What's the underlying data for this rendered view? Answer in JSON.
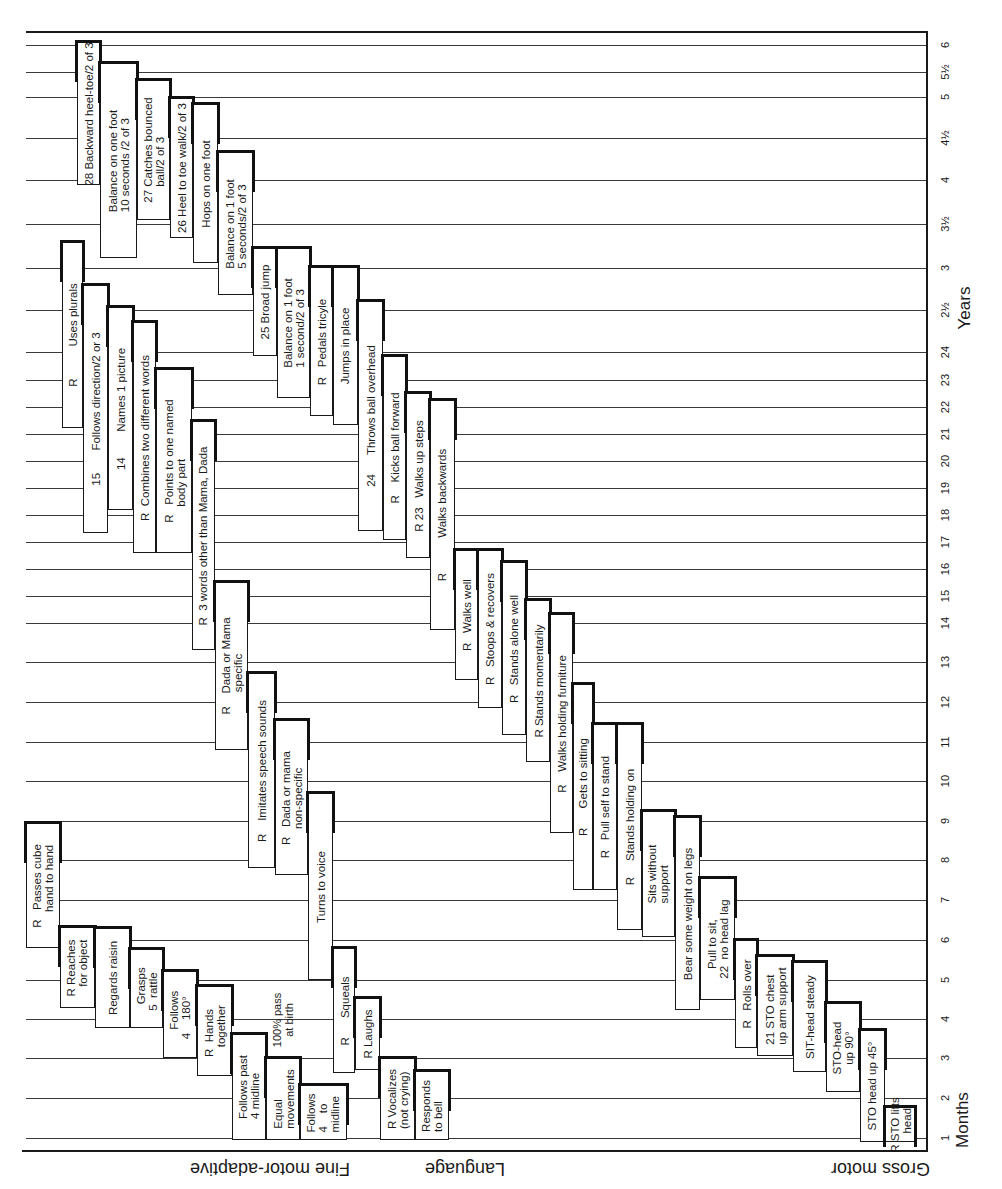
{
  "chart_data": {
    "type": "table",
    "xlabel": "Age",
    "axis_months_label": "Months",
    "axis_years_label": "Years",
    "ticks": [
      {
        "label": "6",
        "y": 45
      },
      {
        "label": "5½",
        "y": 72
      },
      {
        "label": "5",
        "y": 97
      },
      {
        "label": "4½",
        "y": 138
      },
      {
        "label": "4",
        "y": 180
      },
      {
        "label": "3½",
        "y": 224
      },
      {
        "label": "3",
        "y": 268
      },
      {
        "label": "2½",
        "y": 310
      },
      {
        "label": "24",
        "y": 352
      },
      {
        "label": "23",
        "y": 380
      },
      {
        "label": "22",
        "y": 407
      },
      {
        "label": "21",
        "y": 434
      },
      {
        "label": "20",
        "y": 461
      },
      {
        "label": "19",
        "y": 488
      },
      {
        "label": "18",
        "y": 515
      },
      {
        "label": "17",
        "y": 542
      },
      {
        "label": "16",
        "y": 569
      },
      {
        "label": "15",
        "y": 596
      },
      {
        "label": "14",
        "y": 623
      },
      {
        "label": "13",
        "y": 662
      },
      {
        "label": "12",
        "y": 702
      },
      {
        "label": "11",
        "y": 742
      },
      {
        "label": "10",
        "y": 781
      },
      {
        "label": "9",
        "y": 821
      },
      {
        "label": "8",
        "y": 860
      },
      {
        "label": "7",
        "y": 900
      },
      {
        "label": "6",
        "y": 940
      },
      {
        "label": "5",
        "y": 980
      },
      {
        "label": "4",
        "y": 1019
      },
      {
        "label": "3",
        "y": 1058
      },
      {
        "label": "2",
        "y": 1098
      },
      {
        "label": "1",
        "y": 1138
      }
    ],
    "sectors": [
      {
        "name": "Fine motor-adaptive"
      },
      {
        "name": "Language"
      },
      {
        "name": "Gross motor"
      }
    ],
    "items": [
      {
        "sector": "Fine motor-adaptive",
        "text": "R   Passes cube\n     hand to hand",
        "x": 26,
        "w": 34,
        "y": 823,
        "h": 125
      },
      {
        "sector": "Fine motor-adaptive",
        "text": "R Reaches\n   for object",
        "x": 60,
        "w": 35,
        "y": 927,
        "h": 81
      },
      {
        "sector": "Fine motor-adaptive",
        "text": "Regards raisin",
        "x": 95,
        "w": 35,
        "y": 928,
        "h": 100
      },
      {
        "sector": "Fine motor-adaptive",
        "text": "  Grasps\n5  rattle",
        "x": 130,
        "w": 33,
        "y": 949,
        "h": 79
      },
      {
        "sector": "Fine motor-adaptive",
        "text": "   Follows\n4    180°",
        "x": 163,
        "w": 34,
        "y": 971,
        "h": 87
      },
      {
        "sector": "Fine motor-adaptive",
        "text": "R  Hands\n   together",
        "x": 197,
        "w": 35,
        "y": 986,
        "h": 90
      },
      {
        "sector": "Fine motor-adaptive",
        "text": "Follows past\n4 midline",
        "x": 232,
        "w": 34,
        "y": 1034,
        "h": 106
      },
      {
        "sector": "Fine motor-adaptive",
        "text": "Equal\nmovements",
        "x": 266,
        "w": 34,
        "y": 1058,
        "h": 82
      },
      {
        "sector": "Fine motor-adaptive",
        "text": "Follows\n4    to\nmidline",
        "x": 300,
        "w": 47,
        "y": 1085,
        "h": 55
      },
      {
        "sector": "Language",
        "text": "R          Uses plurals",
        "x": 62,
        "w": 21,
        "y": 242,
        "h": 186
      },
      {
        "sector": "Language",
        "text": "15       Follows direction/2 or 3",
        "x": 83,
        "w": 25,
        "y": 285,
        "h": 248
      },
      {
        "sector": "Language",
        "text": "14        Names 1 picture",
        "x": 108,
        "w": 25,
        "y": 307,
        "h": 203
      },
      {
        "sector": "Language",
        "text": "R  Combines two different words",
        "x": 133,
        "w": 23,
        "y": 322,
        "h": 231
      },
      {
        "sector": "Language",
        "text": "R   Points to one named\n     body part",
        "x": 156,
        "w": 36,
        "y": 369,
        "h": 184
      },
      {
        "sector": "Language",
        "text": "R  3 words other than Mama, Dada",
        "x": 192,
        "w": 23,
        "y": 421,
        "h": 229
      },
      {
        "sector": "Language",
        "text": "R    Dada or Mama\n       specific",
        "x": 215,
        "w": 33,
        "y": 582,
        "h": 168
      },
      {
        "sector": "Language",
        "text": "R    Imitates speech sounds",
        "x": 248,
        "w": 27,
        "y": 673,
        "h": 195
      },
      {
        "sector": "Language",
        "text": "R   Dada or mama\n     non-specific",
        "x": 275,
        "w": 33,
        "y": 720,
        "h": 155
      },
      {
        "sector": "Language",
        "text": "Turns to voice",
        "x": 308,
        "w": 25,
        "y": 793,
        "h": 187
      },
      {
        "sector": "Language",
        "text": "R      Squeals",
        "x": 333,
        "w": 22,
        "y": 948,
        "h": 125
      },
      {
        "sector": "Language",
        "text": "R Laughs",
        "x": 355,
        "w": 25,
        "y": 998,
        "h": 72
      },
      {
        "sector": "Language",
        "text": "R Vocalizes\n(not crying)",
        "x": 380,
        "w": 35,
        "y": 1058,
        "h": 82
      },
      {
        "sector": "Language",
        "text": "Responds\nto bell",
        "x": 415,
        "w": 34,
        "y": 1071,
        "h": 69
      },
      {
        "sector": "Gross motor",
        "text": "28 Backward heel-toe/2 of 3",
        "x": 77,
        "w": 23,
        "y": 42,
        "h": 143
      },
      {
        "sector": "Gross motor",
        "text": "Balance on one foot\n10 seconds /2 of 3",
        "x": 100,
        "w": 37,
        "y": 63,
        "h": 195
      },
      {
        "sector": "Gross motor",
        "text": "27 Catches bounced\n     ball/2 of 3",
        "x": 137,
        "w": 33,
        "y": 80,
        "h": 140
      },
      {
        "sector": "Gross motor",
        "text": "26 Heel to toe walk/2 of 3",
        "x": 170,
        "w": 23,
        "y": 98,
        "h": 140
      },
      {
        "sector": "Gross motor",
        "text": "Hops on one foot",
        "x": 193,
        "w": 25,
        "y": 104,
        "h": 159
      },
      {
        "sector": "Gross motor",
        "text": "Balance on 1 foot\n5 seconds/2 of 3",
        "x": 218,
        "w": 35,
        "y": 152,
        "h": 143
      },
      {
        "sector": "Gross motor",
        "text": "25 Broad jump",
        "x": 253,
        "w": 24,
        "y": 248,
        "h": 108
      },
      {
        "sector": "Gross motor",
        "text": "Balance on 1 foot\n1 second/2 of 3",
        "x": 277,
        "w": 33,
        "y": 248,
        "h": 150
      },
      {
        "sector": "Gross motor",
        "text": "R   Pedals tricyle",
        "x": 310,
        "w": 23,
        "y": 267,
        "h": 149
      },
      {
        "sector": "Gross motor",
        "text": "Jumps in place",
        "x": 333,
        "w": 25,
        "y": 267,
        "h": 158
      },
      {
        "sector": "Gross motor",
        "text": "24      Throws ball overhead",
        "x": 358,
        "w": 25,
        "y": 301,
        "h": 230
      },
      {
        "sector": "Gross motor",
        "text": "R    Kicks ball forward",
        "x": 383,
        "w": 23,
        "y": 356,
        "h": 184
      },
      {
        "sector": "Gross motor",
        "text": "R 23   Walks up steps",
        "x": 406,
        "w": 24,
        "y": 393,
        "h": 165
      },
      {
        "sector": "Gross motor",
        "text": "R           Walks backwards",
        "x": 430,
        "w": 25,
        "y": 400,
        "h": 230
      },
      {
        "sector": "Gross motor",
        "text": "R   Walks well",
        "x": 455,
        "w": 23,
        "y": 550,
        "h": 130
      },
      {
        "sector": "Gross motor",
        "text": "R   Stoops & recovers",
        "x": 478,
        "w": 24,
        "y": 550,
        "h": 158
      },
      {
        "sector": "Gross motor",
        "text": "R   Stands alone well",
        "x": 502,
        "w": 24,
        "y": 562,
        "h": 173
      },
      {
        "sector": "Gross motor",
        "text": "R Stands momentarily",
        "x": 526,
        "w": 24,
        "y": 600,
        "h": 162
      },
      {
        "sector": "Gross motor",
        "text": "R    Walks holding furniture",
        "x": 550,
        "w": 23,
        "y": 614,
        "h": 219
      },
      {
        "sector": "Gross motor",
        "text": "R      Gets to sitting",
        "x": 573,
        "w": 20,
        "y": 684,
        "h": 206
      },
      {
        "sector": "Gross motor",
        "text": "R   Pull self to stand",
        "x": 593,
        "w": 24,
        "y": 724,
        "h": 166
      },
      {
        "sector": "Gross motor",
        "text": "R     Stands holding on",
        "x": 617,
        "w": 25,
        "y": 724,
        "h": 206
      },
      {
        "sector": "Gross motor",
        "text": "Sits without\nsupport",
        "x": 642,
        "w": 33,
        "y": 811,
        "h": 126
      },
      {
        "sector": "Gross motor",
        "text": "Bear some weight on legs",
        "x": 675,
        "w": 25,
        "y": 817,
        "h": 193
      },
      {
        "sector": "Gross motor",
        "text": "   Pull to sit,\n22  no head lag",
        "x": 700,
        "w": 35,
        "y": 878,
        "h": 122
      },
      {
        "sector": "Gross motor",
        "text": "R   Rolls over",
        "x": 735,
        "w": 22,
        "y": 940,
        "h": 108
      },
      {
        "sector": "Gross motor",
        "text": "21 STO chest\nup arm support",
        "x": 757,
        "w": 36,
        "y": 956,
        "h": 100
      },
      {
        "sector": "Gross motor",
        "text": "SIT-head steady",
        "x": 793,
        "w": 33,
        "y": 962,
        "h": 110
      },
      {
        "sector": "Gross motor",
        "text": "STO-head\n   up 90°",
        "x": 826,
        "w": 34,
        "y": 1003,
        "h": 89
      },
      {
        "sector": "Gross motor",
        "text": "STO head up 45°",
        "x": 860,
        "w": 25,
        "y": 1030,
        "h": 112
      },
      {
        "sector": "Gross motor",
        "text": "R STO lifts\n      head",
        "x": 885,
        "w": 30,
        "y": 1107,
        "h": 35
      }
    ],
    "annotations": [
      {
        "text": "100% pass\nat birth",
        "x": 266,
        "y": 985,
        "w": 34,
        "h": 70
      }
    ]
  },
  "axes": {
    "months_label": "Months",
    "years_label": "Years"
  },
  "sector_labels": {
    "fine_motor": "Fine motor-adaptive",
    "language": "Language",
    "gross_motor": "Gross motor"
  }
}
